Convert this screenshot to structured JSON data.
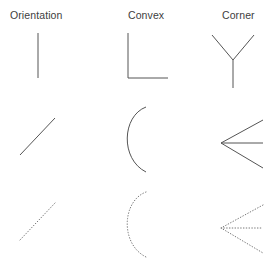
{
  "figure": {
    "background_color": "#ffffff",
    "stroke_color_solid": "#555555",
    "stroke_color_dotted": "#777777",
    "width": 278,
    "height": 271
  },
  "columns": [
    {
      "id": "orientation",
      "label": "Orientation",
      "x": 10
    },
    {
      "id": "convex",
      "label": "Convex",
      "x": 128
    },
    {
      "id": "corner",
      "label": "Corner",
      "x": 222
    }
  ],
  "rows": [
    {
      "id": "row-1",
      "style": "solid",
      "y": 25
    },
    {
      "id": "row-2",
      "style": "solid",
      "y": 103
    },
    {
      "id": "row-3",
      "style": "dotted",
      "y": 188
    }
  ],
  "cells": [
    {
      "id": "cell-orientation-1",
      "row": 0,
      "column": 0,
      "shape_name": "vertical-line",
      "style": "solid",
      "left": 0,
      "top": 25,
      "svg_path": "M 38 8 L 38 53"
    },
    {
      "id": "cell-convex-1",
      "row": 0,
      "column": 1,
      "shape_name": "right-angle-L",
      "style": "solid",
      "left": 95,
      "top": 25,
      "svg_path": "M 33 8 L 33 53 L 73 53"
    },
    {
      "id": "cell-corner-1",
      "row": 0,
      "column": 2,
      "shape_name": "y-junction",
      "style": "solid",
      "left": 190,
      "top": 25,
      "svg_path": "M 22 10 L 43 35 L 64 10 M 43 35 L 43 63"
    },
    {
      "id": "cell-orientation-2",
      "row": 1,
      "column": 0,
      "shape_name": "diagonal-line",
      "style": "solid",
      "left": 0,
      "top": 103,
      "svg_path": "M 20 52 L 55 15"
    },
    {
      "id": "cell-convex-2",
      "row": 1,
      "column": 1,
      "shape_name": "c-arc",
      "style": "solid",
      "left": 95,
      "top": 103,
      "svg_path": "M 51 4 C 27 13 25 56 51 69"
    },
    {
      "id": "cell-corner-2",
      "row": 1,
      "column": 2,
      "shape_name": "arrow-junction",
      "style": "solid",
      "left": 190,
      "top": 103,
      "svg_path": "M 73 17 L 31 40 L 73 65 M 31 40 L 73 40"
    },
    {
      "id": "cell-orientation-3",
      "row": 2,
      "column": 0,
      "shape_name": "diagonal-line-dotted",
      "style": "dotted",
      "left": 0,
      "top": 188,
      "svg_path": "M 20 52 L 55 15"
    },
    {
      "id": "cell-convex-3",
      "row": 2,
      "column": 1,
      "shape_name": "c-arc-dotted",
      "style": "dotted",
      "left": 95,
      "top": 188,
      "svg_path": "M 51 4 C 27 13 25 56 51 69"
    },
    {
      "id": "cell-corner-3",
      "row": 2,
      "column": 2,
      "shape_name": "arrow-junction-dotted",
      "style": "dotted",
      "left": 190,
      "top": 188,
      "svg_path": "M 73 17 L 31 40 L 73 65 M 31 40 L 73 40"
    }
  ]
}
